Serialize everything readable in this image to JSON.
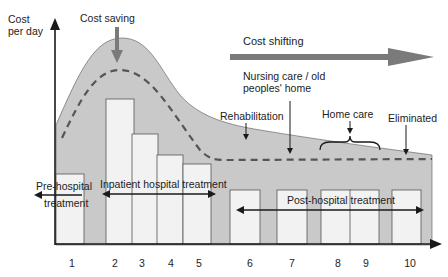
{
  "axes": {
    "y_label_line1": "Cost",
    "y_label_line2": "per day",
    "x_ticks": [
      "1",
      "2",
      "3",
      "4",
      "5",
      "6",
      "7",
      "8",
      "9",
      "10"
    ]
  },
  "annotations": {
    "cost_saving": "Cost saving",
    "cost_shifting": "Cost shifting",
    "nursing_line1": "Nursing care / old",
    "nursing_line2": "peoples' home",
    "rehabilitation": "Rehabilitation",
    "home_care": "Home care",
    "eliminated": "Eliminated"
  },
  "phases": {
    "pre_hospital_line1": "Pre-hospital",
    "pre_hospital_line2": "treatment",
    "inpatient": "Inpatient hospital treatment",
    "post_hospital": "Post-hospital treatment"
  },
  "colors": {
    "shaded_area": "#c9c9c9",
    "bars": "#f2f2f2",
    "arrow_gray": "#7a7a7a",
    "lines": "#1a1a1a"
  }
}
